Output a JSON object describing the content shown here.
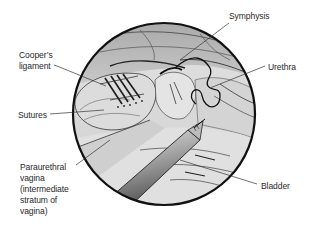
{
  "figure": {
    "type": "surgical illustration",
    "circle": {
      "cx": 164,
      "cy": 114,
      "r": 91
    },
    "colors": {
      "background": "#ffffff",
      "outline": "#111111",
      "tissue_light": "#e6e6e6",
      "tissue_mid": "#bdbdbd",
      "tissue_dark": "#8f8f8f",
      "instrument_light": "#d9d9d9",
      "instrument_dark": "#5e5e5e",
      "label_text": "#2a2a2a",
      "leader_line": "#333333"
    }
  },
  "labels": {
    "symphysis": "Symphysis",
    "coopers_line1": "Cooper’s",
    "coopers_line2": "ligament",
    "urethra": "Urethra",
    "sutures": "Sutures",
    "paraurethral_line1": "Paraurethral",
    "paraurethral_line2": "vagina",
    "paraurethral_line3": "(intermediate",
    "paraurethral_line4": "stratum of",
    "paraurethral_line5": "vagina)",
    "bladder": "Bladder"
  }
}
